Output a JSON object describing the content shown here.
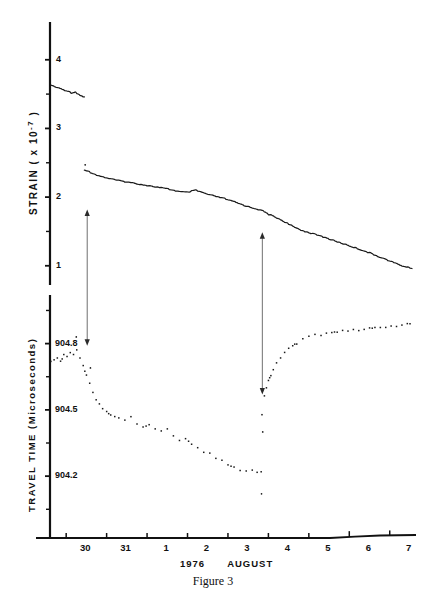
{
  "figure": {
    "caption": "Figure 3",
    "axis_color": "#111111",
    "trace_color": "#1a1a1a"
  },
  "xaxis": {
    "title": "1976    AUGUST",
    "title_parts": {
      "year": "1976",
      "month": "AUGUST"
    },
    "tick_labels": [
      "30",
      "31",
      "1",
      "2",
      "3",
      "4",
      "5",
      "6",
      "7",
      "8"
    ],
    "tick_values": [
      30,
      31,
      1,
      2,
      3,
      4,
      5,
      6,
      7,
      8
    ],
    "data_range_days": [
      29.6,
      38.6
    ],
    "day_numbers": [
      30,
      31,
      32,
      33,
      34,
      35,
      36,
      37,
      38
    ]
  },
  "panels": {
    "strain": {
      "axis_label": "STRAIN   (  x 10",
      "axis_label_exponent": "-7",
      "axis_label_close": "  )",
      "axis_label_full": "STRAIN ( x 10-7 )",
      "unit_multiplier": "x 10^-7",
      "tick_labels": [
        "4",
        "3",
        "2",
        "1"
      ],
      "tick_values": [
        4,
        3,
        2,
        1
      ],
      "minor_tick_values": [
        3.5,
        2.5,
        1.5
      ],
      "ylim": [
        0.72,
        4.55
      ]
    },
    "travel_time": {
      "axis_label": "TRAVEL  TIME  (Microseconds)",
      "tick_labels": [
        "904.8",
        "904.5",
        "904.2"
      ],
      "tick_values": [
        904.8,
        904.5,
        904.2
      ],
      "minor_tick_values": [
        904.95,
        904.65,
        904.35,
        904.05
      ],
      "ylim": [
        903.92,
        905.02
      ]
    }
  },
  "annotations": [
    {
      "name": "event-arrow-1",
      "kind": "double-headed-vertical-arrow",
      "x_day": 30.52,
      "y_top_strain": 1.82,
      "y_bottom_travel_time": 904.79
    },
    {
      "name": "event-arrow-2",
      "kind": "double-headed-vertical-arrow",
      "x_day": 34.85,
      "y_top_strain": 1.49,
      "y_bottom_travel_time": 904.57
    }
  ],
  "chart_data": {
    "type": "line",
    "title": "Figure 3",
    "subtitle": "",
    "xlabel": "1976    AUGUST",
    "grid": false,
    "legend": "none",
    "panels": [
      {
        "name": "strain-panel",
        "ylabel": "STRAIN ( x 10-7 )",
        "ylim": [
          0.72,
          4.55
        ],
        "yticks": [
          4,
          3,
          2,
          1
        ],
        "xlim": [
          29.6,
          38.6
        ],
        "series": [
          {
            "name": "strain-segment-1",
            "style": "continuous-line",
            "x": [
              29.62,
              29.75,
              29.9,
              30.02,
              30.12,
              30.22,
              30.3,
              30.38,
              30.45
            ],
            "y": [
              3.63,
              3.6,
              3.57,
              3.55,
              3.52,
              3.53,
              3.5,
              3.47,
              3.46
            ]
          },
          {
            "name": "strain-segment-2",
            "style": "continuous-line",
            "x": [
              30.45,
              30.6,
              30.8,
              31.0,
              31.3,
              31.6,
              31.9,
              32.2,
              32.5,
              32.8,
              33.0,
              33.2,
              33.4,
              33.55,
              33.7,
              33.9,
              34.1,
              34.3,
              34.5,
              34.7,
              34.85,
              35.0,
              35.2,
              35.4,
              35.6,
              35.9,
              36.2,
              36.5,
              36.8,
              37.1,
              37.4,
              37.7,
              38.0,
              38.3,
              38.55
            ],
            "y": [
              2.4,
              2.36,
              2.31,
              2.28,
              2.24,
              2.21,
              2.18,
              2.15,
              2.12,
              2.08,
              2.07,
              2.1,
              2.06,
              2.03,
              2.01,
              1.98,
              1.94,
              1.9,
              1.86,
              1.83,
              1.8,
              1.75,
              1.7,
              1.64,
              1.57,
              1.5,
              1.45,
              1.39,
              1.33,
              1.27,
              1.21,
              1.14,
              1.07,
              1.0,
              0.96
            ]
          }
        ]
      },
      {
        "name": "travel-time-panel",
        "ylabel": "TRAVEL TIME (Microseconds)",
        "ylim": [
          903.92,
          905.02
        ],
        "yticks": [
          904.8,
          904.5,
          904.2
        ],
        "xlim": [
          29.6,
          38.6
        ],
        "series": [
          {
            "name": "travel-time-segment-1",
            "style": "dotted-trace",
            "x": [
              29.62,
              29.7,
              29.78,
              29.86,
              29.94,
              30.02,
              30.1,
              30.18,
              30.26,
              30.34,
              30.42,
              30.5,
              30.58,
              30.66,
              30.74,
              30.82,
              30.9,
              31.0,
              31.1,
              31.2,
              31.3,
              31.45,
              31.6,
              31.75,
              31.9,
              32.05,
              32.2,
              32.35,
              32.5,
              32.65,
              32.8,
              32.95,
              33.1,
              33.25,
              33.4,
              33.55,
              33.7,
              33.85,
              34.0,
              34.15,
              34.3,
              34.45,
              34.6,
              34.72,
              34.82
            ],
            "y": [
              904.72,
              904.73,
              904.74,
              904.72,
              904.75,
              904.74,
              904.76,
              904.75,
              904.77,
              904.73,
              904.7,
              904.66,
              904.62,
              904.58,
              904.55,
              904.53,
              904.51,
              904.49,
              904.48,
              904.47,
              904.46,
              904.45,
              904.47,
              904.44,
              904.42,
              904.43,
              904.41,
              904.4,
              904.41,
              904.38,
              904.36,
              904.37,
              904.34,
              904.33,
              904.31,
              904.3,
              904.28,
              904.27,
              904.25,
              904.24,
              904.23,
              904.22,
              904.23,
              904.22,
              904.22
            ]
          },
          {
            "name": "travel-time-segment-2",
            "style": "dotted-trace",
            "x": [
              34.84,
              34.9,
              34.95,
              35.0,
              35.06,
              35.12,
              35.2,
              35.3,
              35.4,
              35.5,
              35.6,
              35.7,
              35.85,
              36.0,
              36.15,
              36.3,
              36.5,
              36.7,
              36.9,
              37.1,
              37.3,
              37.5,
              37.7,
              37.9,
              38.1,
              38.3,
              38.5
            ],
            "y": [
              904.48,
              904.56,
              904.6,
              904.63,
              904.66,
              904.68,
              904.71,
              904.74,
              904.76,
              904.78,
              904.79,
              904.8,
              904.82,
              904.83,
              904.84,
              904.84,
              904.85,
              904.85,
              904.86,
              904.86,
              904.86,
              904.87,
              904.87,
              904.87,
              904.88,
              904.88,
              904.89
            ]
          }
        ]
      }
    ]
  }
}
